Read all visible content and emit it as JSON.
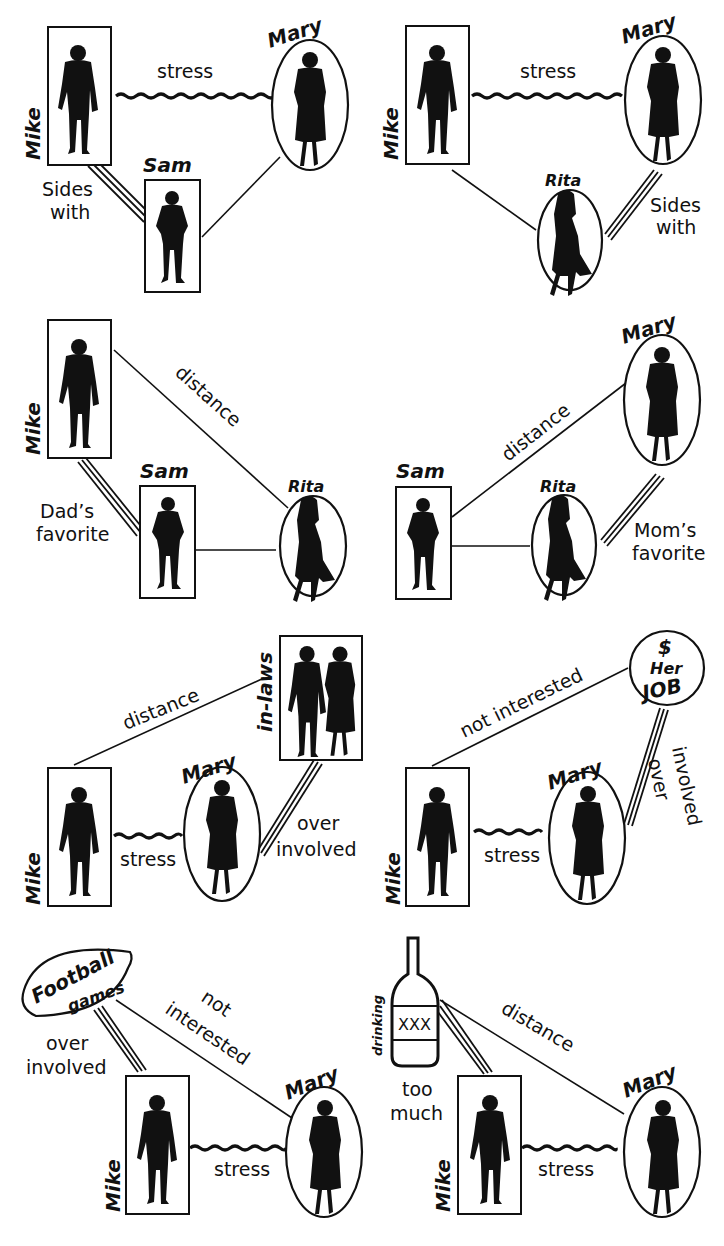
{
  "diagram": {
    "title": "",
    "panels": [
      {
        "id": "p1",
        "nodes": {
          "mike": "Mike",
          "mary": "Mary",
          "sam": "Sam"
        },
        "edges": [
          {
            "from": "Mike",
            "to": "Mary",
            "type": "stress",
            "label": "stress"
          },
          {
            "from": "Mike",
            "to": "Sam",
            "type": "alliance",
            "label_line1": "Sides",
            "label_line2": "with"
          },
          {
            "from": "Sam",
            "to": "Mary",
            "type": "normal",
            "label": ""
          }
        ]
      },
      {
        "id": "p2",
        "nodes": {
          "mike": "Mike",
          "mary": "Mary",
          "rita": "Rita"
        },
        "edges": [
          {
            "from": "Mike",
            "to": "Mary",
            "type": "stress",
            "label": "stress"
          },
          {
            "from": "Mary",
            "to": "Rita",
            "type": "alliance",
            "label_line1": "Sides",
            "label_line2": "with"
          },
          {
            "from": "Mike",
            "to": "Rita",
            "type": "normal",
            "label": ""
          }
        ]
      },
      {
        "id": "p3",
        "nodes": {
          "mike": "Mike",
          "sam": "Sam",
          "rita": "Rita"
        },
        "edges": [
          {
            "from": "Mike",
            "to": "Rita",
            "type": "distance",
            "label": "distance"
          },
          {
            "from": "Mike",
            "to": "Sam",
            "type": "alliance",
            "label_line1": "Dad’s",
            "label_line2": "favorite"
          },
          {
            "from": "Sam",
            "to": "Rita",
            "type": "normal",
            "label": ""
          }
        ]
      },
      {
        "id": "p4",
        "nodes": {
          "sam": "Sam",
          "mary": "Mary",
          "rita": "Rita"
        },
        "edges": [
          {
            "from": "Sam",
            "to": "Mary",
            "type": "distance",
            "label": "distance"
          },
          {
            "from": "Mary",
            "to": "Rita",
            "type": "alliance",
            "label_line1": "Mom’s",
            "label_line2": "favorite"
          },
          {
            "from": "Sam",
            "to": "Rita",
            "type": "normal",
            "label": ""
          }
        ]
      },
      {
        "id": "p5",
        "nodes": {
          "mike": "Mike",
          "mary": "Mary",
          "inlaws": "in-laws"
        },
        "edges": [
          {
            "from": "Mike",
            "to": "in-laws",
            "type": "distance",
            "label": "distance"
          },
          {
            "from": "Mike",
            "to": "Mary",
            "type": "stress",
            "label": "stress"
          },
          {
            "from": "Mary",
            "to": "in-laws",
            "type": "overinvolved",
            "label_line1": "over",
            "label_line2": "involved"
          }
        ]
      },
      {
        "id": "p6",
        "nodes": {
          "mike": "Mike",
          "mary": "Mary",
          "job_symbol": "$",
          "job_line1": "Her",
          "job_line2": "JOB"
        },
        "edges": [
          {
            "from": "Mike",
            "to": "Her JOB",
            "type": "distance",
            "label": "not interested"
          },
          {
            "from": "Mike",
            "to": "Mary",
            "type": "stress",
            "label": "stress"
          },
          {
            "from": "Mary",
            "to": "Her JOB",
            "type": "overinvolved",
            "label_line1": "over",
            "label_line2": "involved"
          }
        ]
      },
      {
        "id": "p7",
        "nodes": {
          "mike": "Mike",
          "mary": "Mary",
          "football_line1": "Football",
          "football_line2": "games"
        },
        "edges": [
          {
            "from": "Mike",
            "to": "Football games",
            "type": "overinvolved",
            "label_line1": "over",
            "label_line2": "involved"
          },
          {
            "from": "Football games",
            "to": "Mary",
            "type": "distance",
            "label_line1": "not",
            "label_line2": "interested"
          },
          {
            "from": "Mike",
            "to": "Mary",
            "type": "stress",
            "label": "stress"
          }
        ]
      },
      {
        "id": "p8",
        "nodes": {
          "mike": "Mike",
          "mary": "Mary",
          "bottle_label": "XXX",
          "bottle_side": "drinking"
        },
        "edges": [
          {
            "from": "Mike",
            "to": "drinking",
            "type": "overinvolved",
            "label_line1": "too",
            "label_line2": "much"
          },
          {
            "from": "drinking",
            "to": "Mary",
            "type": "distance",
            "label": "distance"
          },
          {
            "from": "Mike",
            "to": "Mary",
            "type": "stress",
            "label": "stress"
          }
        ]
      }
    ]
  }
}
